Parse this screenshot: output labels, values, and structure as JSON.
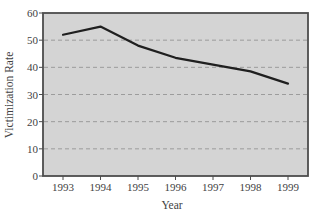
{
  "chart_data": {
    "type": "line",
    "title": "",
    "xlabel": "Year",
    "ylabel": "Victimization Rate",
    "x": [
      1993,
      1994,
      1995,
      1996,
      1997,
      1998,
      1999
    ],
    "x_tick_labels": [
      "1993",
      "1994",
      "1995",
      "1996",
      "1997",
      "1998",
      "1999"
    ],
    "series": [
      {
        "name": "Victimization Rate",
        "values": [
          52,
          55,
          48,
          43.5,
          41,
          38.5,
          34
        ]
      }
    ],
    "ylim": [
      0,
      60
    ],
    "yticks": [
      0,
      10,
      20,
      30,
      40,
      50,
      60
    ],
    "grid": {
      "horizontal": true,
      "style": "dashed",
      "at": [
        10,
        20,
        30,
        40,
        50
      ]
    },
    "legend": "none"
  },
  "colors": {
    "page_background": "#ffffff",
    "plot_background": "#d4d4d4",
    "plot_border": "#4d4d4d",
    "gridline": "#9c9c9c",
    "data_line": "#1f1f1f",
    "text": "#424242"
  }
}
